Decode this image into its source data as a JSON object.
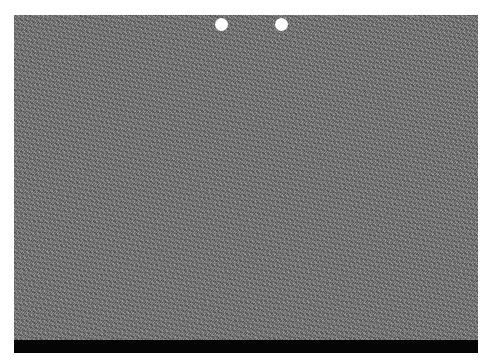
{
  "image": {
    "type": "autostereogram",
    "description": "Random-dot stereogram with gray noise texture",
    "guide_dots": [
      {
        "name": "left-guide-dot",
        "cx": 221,
        "cy": 24
      },
      {
        "name": "right-guide-dot",
        "cx": 281,
        "cy": 24
      }
    ],
    "colors": {
      "noise_mid": "#7a7a7a",
      "guide_dot": "#ffffff",
      "bottom_band": "#050505",
      "background": "#ffffff"
    }
  }
}
